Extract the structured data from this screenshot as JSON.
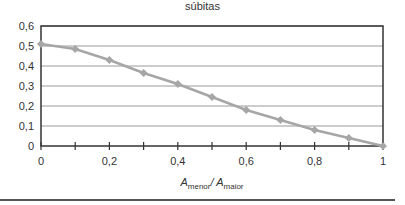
{
  "chart_data": {
    "type": "line",
    "title": "súbitas",
    "xlabel": "A_menor / A_maior",
    "xlabel_parts": {
      "var1": "A",
      "sub1": "menor",
      "sep": "/ ",
      "var2": "A",
      "sub2": "maior"
    },
    "ylabel": "",
    "x": [
      0,
      0.1,
      0.2,
      0.3,
      0.4,
      0.5,
      0.6,
      0.7,
      0.8,
      0.9,
      1.0
    ],
    "series": [
      {
        "name": "coeficiente",
        "values": [
          0.51,
          0.485,
          0.43,
          0.365,
          0.31,
          0.245,
          0.18,
          0.13,
          0.08,
          0.04,
          0.0
        ],
        "color": "#a6a6a6",
        "marker": "diamond"
      }
    ],
    "xlim": [
      0,
      1
    ],
    "ylim": [
      0,
      0.6
    ],
    "x_tick_labels": [
      "0",
      "0,2",
      "0,4",
      "0,6",
      "0,8",
      "1"
    ],
    "y_tick_labels": [
      "0",
      "0,1",
      "0,2",
      "0,3",
      "0,4",
      "0,5",
      "0,6"
    ],
    "grid": true,
    "legend": "none"
  }
}
